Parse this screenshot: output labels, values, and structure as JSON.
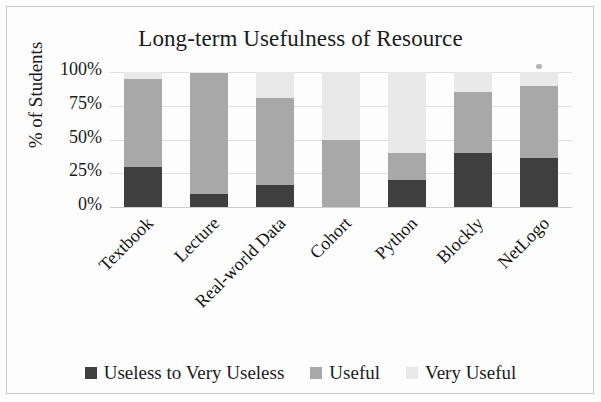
{
  "chart_data": {
    "type": "bar",
    "stacked": true,
    "title": "Long-term Usefulness of Resource",
    "xlabel": "",
    "ylabel": "% of Students",
    "ylim": [
      0,
      100
    ],
    "ytick_labels": [
      "100%",
      "75%",
      "50%",
      "25%",
      "0%"
    ],
    "ytick_values": [
      100,
      75,
      50,
      25,
      0
    ],
    "grid": true,
    "legend_position": "bottom",
    "categories": [
      "Textbook",
      "Lecture",
      "Real-world Data",
      "Cohort",
      "Python",
      "Blockly",
      "NetLogo"
    ],
    "series": [
      {
        "name": "Useless to Very Useless",
        "color": "#3f3f3f",
        "values": [
          30,
          10,
          16,
          0,
          20,
          40,
          36
        ]
      },
      {
        "name": "Useful",
        "color": "#a8a8a8",
        "values": [
          65,
          89,
          65,
          50,
          20,
          45,
          54
        ]
      },
      {
        "name": "Very Useful",
        "color": "#e9e9e9",
        "values": [
          5,
          1,
          19,
          50,
          60,
          15,
          10
        ]
      }
    ]
  },
  "figure": {
    "background": "#fdfdfd",
    "frame_color": "#c9c9c9"
  }
}
